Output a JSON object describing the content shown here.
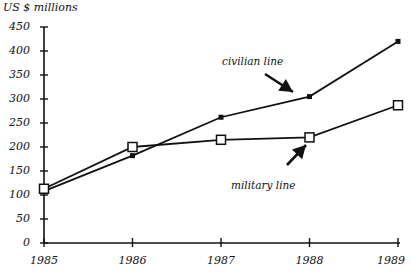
{
  "chart_data": {
    "type": "line",
    "title": "",
    "ylabel": "US $ millions",
    "xlabel": "",
    "x": [
      "1985",
      "1986",
      "1987",
      "1988",
      "1989"
    ],
    "yticks": [
      "0",
      "50",
      "100",
      "150",
      "200",
      "250",
      "300",
      "350",
      "400",
      "450"
    ],
    "ylim": [
      0,
      450
    ],
    "grid": false,
    "series": [
      {
        "name": "civilian line",
        "marker": "filled-square",
        "values": [
          108,
          182,
          262,
          305,
          420
        ]
      },
      {
        "name": "military line",
        "marker": "open-square",
        "values": [
          113,
          200,
          215,
          220,
          287
        ]
      }
    ],
    "annotations": [
      {
        "text": "civilian line",
        "points_to": {
          "series": "civilian line",
          "x": "1988"
        }
      },
      {
        "text": "military line",
        "points_to": {
          "series": "military line",
          "x": "1988"
        }
      }
    ]
  },
  "colors": {
    "line": "#111111",
    "background": "#ffffff"
  }
}
